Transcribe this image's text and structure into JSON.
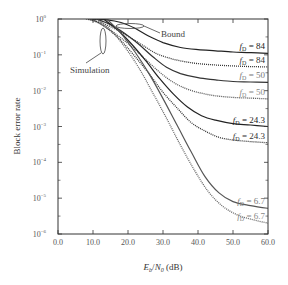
{
  "chart_data": {
    "type": "line",
    "title": "",
    "xlabel": "E_b/N_0 (dB)",
    "xlabel_parts": {
      "e": "E",
      "e_sub": "b",
      "slash": "/",
      "n": "N",
      "n_sub": "0",
      "unit": " (dB)"
    },
    "ylabel": "Block error rate",
    "xlim": [
      0,
      60
    ],
    "ylim": [
      1e-06,
      1
    ],
    "yscale": "log",
    "grid": false,
    "x_ticks": [
      0,
      10,
      20,
      30,
      40,
      50,
      60
    ],
    "x_tick_labels": [
      "0.0",
      "10.0",
      "20.0",
      "30.0",
      "40.0",
      "50.0",
      "60.0"
    ],
    "y_ticks": [
      0,
      -1,
      -2,
      -3,
      -4,
      -5,
      -6
    ],
    "y_tick_labels": [
      "10",
      "10",
      "10",
      "10",
      "10",
      "10",
      "10"
    ],
    "y_tick_exponents": [
      "0",
      "−1",
      "−2",
      "−3",
      "−4",
      "−5",
      "−6"
    ],
    "annotations": [
      {
        "text": "Bound",
        "x": 27,
        "y": 0.55
      },
      {
        "text": "Simulation",
        "x": 5,
        "y": 0.11
      }
    ],
    "series": [
      {
        "name": "Bound f_D = 84",
        "kind": "bound",
        "fd": "84",
        "color": "#222222",
        "x": [
          9,
          14,
          18,
          22,
          26,
          30,
          35,
          40,
          45,
          50,
          55,
          60
        ],
        "y": [
          1.0,
          0.95,
          0.8,
          0.55,
          0.33,
          0.22,
          0.16,
          0.14,
          0.13,
          0.12,
          0.115,
          0.11
        ]
      },
      {
        "name": "Simulation f_D = 84",
        "kind": "sim",
        "fd": "84",
        "color": "#333333",
        "x": [
          8,
          12,
          16,
          20,
          24,
          28,
          32,
          36,
          40,
          45,
          50,
          55,
          60
        ],
        "y": [
          1.0,
          0.8,
          0.55,
          0.33,
          0.19,
          0.11,
          0.08,
          0.065,
          0.057,
          0.052,
          0.049,
          0.047,
          0.046
        ]
      },
      {
        "name": "Bound f_D = 50",
        "kind": "bound",
        "fd": "50",
        "color": "#333333",
        "x": [
          11,
          15,
          19,
          23,
          27,
          31,
          35,
          40,
          45,
          50,
          55,
          60
        ],
        "y": [
          1.0,
          0.7,
          0.4,
          0.2,
          0.09,
          0.045,
          0.03,
          0.023,
          0.02,
          0.018,
          0.0175,
          0.017
        ]
      },
      {
        "name": "Simulation f_D = 50",
        "kind": "sim",
        "fd": "50",
        "color": "#555555",
        "x": [
          9,
          13,
          17,
          21,
          25,
          29,
          33,
          37,
          41,
          45,
          50,
          55,
          60
        ],
        "y": [
          1.0,
          0.65,
          0.35,
          0.17,
          0.075,
          0.033,
          0.017,
          0.011,
          0.0085,
          0.0072,
          0.0065,
          0.0062,
          0.0059
        ]
      },
      {
        "name": "Bound f_D = 24.3",
        "kind": "bound",
        "fd": "24.3",
        "color": "#222222",
        "x": [
          13,
          17,
          21,
          25,
          29,
          33,
          37,
          41,
          45,
          50,
          55,
          60
        ],
        "y": [
          1.0,
          0.5,
          0.2,
          0.07,
          0.022,
          0.008,
          0.0035,
          0.002,
          0.0015,
          0.0012,
          0.0011,
          0.001
        ]
      },
      {
        "name": "Simulation f_D = 24.3",
        "kind": "sim",
        "fd": "24.3",
        "color": "#333333",
        "x": [
          10,
          14,
          18,
          22,
          26,
          30,
          34,
          38,
          42,
          46,
          50,
          55,
          60
        ],
        "y": [
          1.0,
          0.55,
          0.25,
          0.09,
          0.03,
          0.009,
          0.0033,
          0.0013,
          0.00075,
          0.0005,
          0.00042,
          0.00038,
          0.00035
        ]
      },
      {
        "name": "Bound f_D = 6.7",
        "kind": "bound",
        "fd": "6.7",
        "color": "#555555",
        "x": [
          14,
          18,
          22,
          26,
          30,
          34,
          38,
          42,
          46,
          50,
          55,
          60
        ],
        "y": [
          1.0,
          0.4,
          0.12,
          0.03,
          0.006,
          0.0011,
          0.0002,
          4e-05,
          1.4e-05,
          8e-06,
          6.2e-06,
          5.2e-06
        ]
      },
      {
        "name": "Simulation f_D = 6.7",
        "kind": "sim",
        "fd": "6.7",
        "color": "#666666",
        "x": [
          11,
          15,
          19,
          23,
          27,
          31,
          35,
          39,
          43,
          47,
          51,
          55,
          60
        ],
        "y": [
          1.0,
          0.5,
          0.17,
          0.045,
          0.009,
          0.0017,
          0.0003,
          6e-05,
          1.5e-05,
          6e-06,
          3.5e-06,
          2.6e-06,
          2e-06
        ]
      }
    ],
    "curve_labels": [
      {
        "series": 0,
        "prefix": "f",
        "sub": "D",
        "value": " = 84",
        "color": "#222222"
      },
      {
        "series": 1,
        "prefix": "f",
        "sub": "D",
        "value": " = 84",
        "color": "#333333"
      },
      {
        "series": 2,
        "prefix": "f",
        "sub": "D",
        "value": " = 50",
        "color": "#777777"
      },
      {
        "series": 3,
        "prefix": "f",
        "sub": "D",
        "value": " = 50",
        "color": "#888888"
      },
      {
        "series": 4,
        "prefix": "f",
        "sub": "D",
        "value": " = 24.3",
        "color": "#222222"
      },
      {
        "series": 5,
        "prefix": "f",
        "sub": "D",
        "value": " = 24.3",
        "color": "#333333"
      },
      {
        "series": 6,
        "prefix": "f",
        "sub": "D",
        "value": " = 6.7",
        "color": "#777777"
      },
      {
        "series": 7,
        "prefix": "f",
        "sub": "D",
        "value": " = 6.7",
        "color": "#888888"
      }
    ]
  }
}
